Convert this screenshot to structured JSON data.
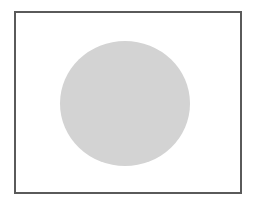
{
  "diagram": {
    "frame": {
      "border_color": "#5a5a5a",
      "background_color": "#ffffff"
    },
    "shape": {
      "type": "circle",
      "fill_color": "#d3d3d3"
    }
  }
}
